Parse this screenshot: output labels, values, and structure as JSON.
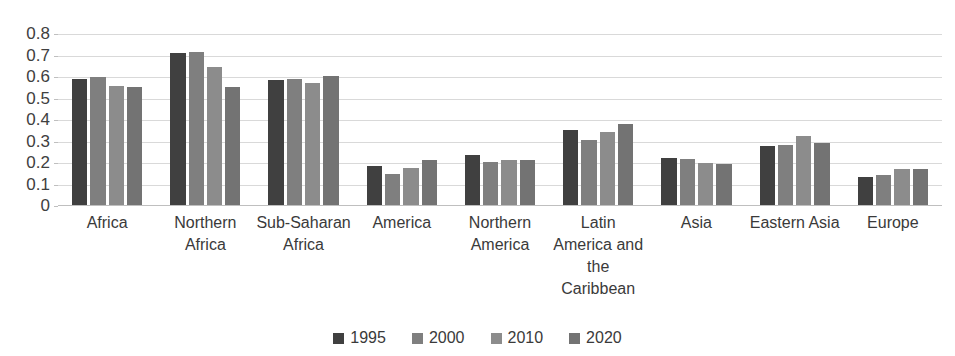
{
  "chart_data": {
    "type": "bar",
    "title": "",
    "subtitle": "",
    "xlabel": "",
    "ylabel": "",
    "ylim": [
      0,
      0.8
    ],
    "grid": true,
    "legend_position": "bottom",
    "y_ticks": [
      "0.8",
      "0.7",
      "0.6",
      "0.5",
      "0.4",
      "0.3",
      "0.2",
      "0.1",
      "0"
    ],
    "y_tick_values": [
      0.8,
      0.7,
      0.6,
      0.5,
      0.4,
      0.3,
      0.2,
      0.1,
      0
    ],
    "categories": [
      "Africa",
      "Northern Africa",
      "Sub-Saharan Africa",
      "America",
      "Northern America",
      "Latin America and the Caribbean",
      "Asia",
      "Eastern Asia",
      "Europe"
    ],
    "series": [
      {
        "name": "1995",
        "color": "#404040",
        "values": [
          0.59,
          0.71,
          0.585,
          0.185,
          0.235,
          0.355,
          0.225,
          0.28,
          0.135
        ]
      },
      {
        "name": "2000",
        "color": "#7f7f7f",
        "values": [
          0.6,
          0.715,
          0.59,
          0.15,
          0.205,
          0.305,
          0.22,
          0.285,
          0.145
        ]
      },
      {
        "name": "2010",
        "color": "#8c8c8c",
        "values": [
          0.56,
          0.645,
          0.57,
          0.175,
          0.215,
          0.345,
          0.2,
          0.325,
          0.17
        ]
      },
      {
        "name": "2020",
        "color": "#737373",
        "values": [
          0.555,
          0.555,
          0.605,
          0.215,
          0.215,
          0.38,
          0.195,
          0.295,
          0.17
        ]
      }
    ]
  },
  "colors": {
    "gridline": "#d9d9d9",
    "axis": "#bfbfbf",
    "text": "#3a3a3a",
    "background": "#ffffff"
  }
}
